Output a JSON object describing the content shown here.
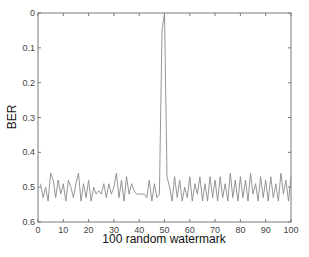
{
  "chart_data": {
    "type": "line",
    "title": "",
    "xlabel": "100 random watermark",
    "ylabel": "BER",
    "xlim": [
      0,
      100
    ],
    "ylim": [
      0,
      0.6
    ],
    "y_inverted": true,
    "grid": false,
    "legend": null,
    "xticks": [
      0,
      10,
      20,
      30,
      40,
      50,
      60,
      70,
      80,
      90,
      100
    ],
    "yticks": [
      0,
      0.1,
      0.2,
      0.3,
      0.4,
      0.5,
      0.6
    ],
    "ytick_labels": [
      "0",
      "0.1",
      "0.2",
      "0.3",
      "0.4",
      "0.5",
      "0.6"
    ],
    "series": [
      {
        "name": "BER",
        "color": "#8a8a8a",
        "x": [
          1,
          2,
          3,
          4,
          5,
          6,
          7,
          8,
          9,
          10,
          11,
          12,
          13,
          14,
          15,
          16,
          17,
          18,
          19,
          20,
          21,
          22,
          23,
          24,
          25,
          26,
          27,
          28,
          29,
          30,
          31,
          32,
          33,
          34,
          35,
          36,
          37,
          38,
          39,
          40,
          41,
          42,
          43,
          44,
          45,
          46,
          47,
          48,
          49,
          50,
          51,
          52,
          53,
          54,
          55,
          56,
          57,
          58,
          59,
          60,
          61,
          62,
          63,
          64,
          65,
          66,
          67,
          68,
          69,
          70,
          71,
          72,
          73,
          74,
          75,
          76,
          77,
          78,
          79,
          80,
          81,
          82,
          83,
          84,
          85,
          86,
          87,
          88,
          89,
          90,
          91,
          92,
          93,
          94,
          95,
          96,
          97,
          98,
          99,
          100
        ],
        "values": [
          0.49,
          0.53,
          0.5,
          0.54,
          0.46,
          0.48,
          0.53,
          0.48,
          0.52,
          0.49,
          0.54,
          0.48,
          0.5,
          0.53,
          0.49,
          0.46,
          0.54,
          0.49,
          0.53,
          0.48,
          0.54,
          0.5,
          0.52,
          0.51,
          0.52,
          0.49,
          0.53,
          0.49,
          0.52,
          0.5,
          0.46,
          0.53,
          0.48,
          0.54,
          0.47,
          0.52,
          0.49,
          0.51,
          0.52,
          0.52,
          0.52,
          0.52,
          0.53,
          0.48,
          0.54,
          0.49,
          0.53,
          0.52,
          0.05,
          0.0,
          0.47,
          0.5,
          0.54,
          0.47,
          0.53,
          0.48,
          0.54,
          0.5,
          0.53,
          0.47,
          0.54,
          0.49,
          0.52,
          0.47,
          0.54,
          0.49,
          0.54,
          0.47,
          0.53,
          0.48,
          0.54,
          0.47,
          0.53,
          0.49,
          0.54,
          0.46,
          0.53,
          0.48,
          0.54,
          0.47,
          0.53,
          0.48,
          0.54,
          0.46,
          0.52,
          0.49,
          0.54,
          0.47,
          0.53,
          0.48,
          0.54,
          0.47,
          0.53,
          0.49,
          0.54,
          0.46,
          0.52,
          0.48,
          0.54,
          0.47
        ]
      }
    ]
  }
}
